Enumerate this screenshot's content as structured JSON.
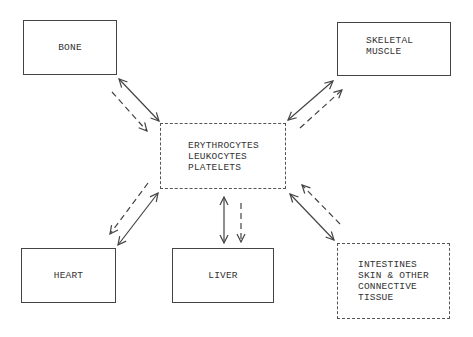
{
  "diagram": {
    "center": {
      "lines": [
        "ERYTHROCYTES",
        "LEUKOCYTES",
        "PLATELETS"
      ],
      "style": "dashed"
    },
    "nodes": [
      {
        "id": "bone",
        "lines": [
          "BONE"
        ],
        "style": "solid"
      },
      {
        "id": "skeletal-muscle",
        "lines": [
          "SKELETAL",
          "MUSCLE"
        ],
        "style": "solid"
      },
      {
        "id": "heart",
        "lines": [
          "HEART"
        ],
        "style": "solid"
      },
      {
        "id": "liver",
        "lines": [
          "LIVER"
        ],
        "style": "solid"
      },
      {
        "id": "intestines",
        "lines": [
          "INTESTINES",
          "SKIN & OTHER",
          "CONNECTIVE",
          "TISSUE"
        ],
        "style": "dashed"
      }
    ],
    "edges": [
      {
        "from": "bone",
        "to": "center",
        "solid": "bidirectional",
        "dashed": "to-center"
      },
      {
        "from": "skeletal-muscle",
        "to": "center",
        "solid": "bidirectional",
        "dashed": "to-skeletal-muscle"
      },
      {
        "from": "heart",
        "to": "center",
        "solid": "bidirectional",
        "dashed": "to-heart"
      },
      {
        "from": "liver",
        "to": "center",
        "solid": "bidirectional",
        "dashed": "to-liver"
      },
      {
        "from": "intestines",
        "to": "center",
        "solid": "bidirectional",
        "dashed": "to-center"
      }
    ]
  }
}
